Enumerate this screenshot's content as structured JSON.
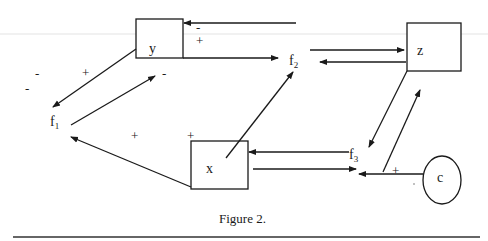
{
  "figure": {
    "caption": "Figure 2."
  },
  "nodes": {
    "y": {
      "label": "y",
      "shape": "rectangle"
    },
    "z": {
      "label": "z",
      "shape": "rectangle"
    },
    "x": {
      "label": "x",
      "shape": "rectangle"
    },
    "c": {
      "label": "c",
      "shape": "ellipse"
    }
  },
  "flows": {
    "f1": {
      "base": "f",
      "sub": "1"
    },
    "f2": {
      "base": "f",
      "sub": "2"
    },
    "f3": {
      "base": "f",
      "sub": "3"
    }
  },
  "signs": {
    "y_top_in": "-",
    "y_right_out": "+",
    "y_to_f1_a": "-",
    "y_to_f1_b": "-",
    "y_to_f1_plus": "+",
    "f1_to_y": "-",
    "x_to_f1_plus": "+",
    "x_top_plus": "+",
    "c_to_f3_plus": "+"
  },
  "colors": {
    "ink": "#1a1a1a",
    "background": "#ffffff"
  }
}
